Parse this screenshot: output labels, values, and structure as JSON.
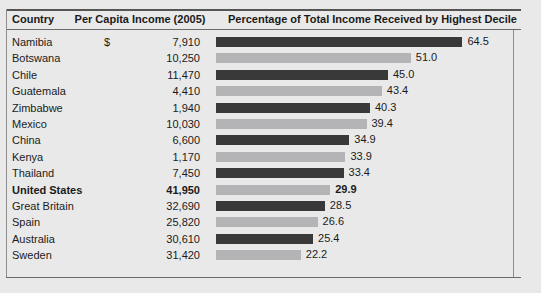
{
  "header": {
    "country": "Country",
    "income": "Per Capita Income (2005)",
    "percentage": "Percentage of Total Income Received by Highest Decile"
  },
  "colors": {
    "bar_dark": "#39393a",
    "bar_light": "#b4b4b6",
    "background": "#e9e9e9",
    "rule": "#6a6a6a"
  },
  "chart_data": {
    "type": "bar",
    "title": "Percentage of Total Income Received by Highest Decile",
    "xlabel": "",
    "ylabel": "Country",
    "orientation": "horizontal",
    "grid": false,
    "legend": "none",
    "xlim": [
      0,
      70
    ],
    "categories": [
      "Namibia",
      "Botswana",
      "Chile",
      "Guatemala",
      "Zimbabwe",
      "Mexico",
      "China",
      "Kenya",
      "Thailand",
      "United States",
      "Great Britain",
      "Spain",
      "Australia",
      "Sweden"
    ],
    "values": [
      64.5,
      51.0,
      45.0,
      43.4,
      40.3,
      39.4,
      34.9,
      33.9,
      33.4,
      29.9,
      28.5,
      26.6,
      25.4,
      22.2
    ],
    "value_labels": [
      "64.5",
      "51.0",
      "45.0",
      "43.4",
      "40.3",
      "39.4",
      "34.9",
      "33.9",
      "33.4",
      "29.9",
      "28.5",
      "26.6",
      "25.4",
      "22.2"
    ]
  },
  "rows": [
    {
      "country": "Namibia",
      "currency": "$",
      "income": "7,910",
      "value": 64.5,
      "label": "64.5",
      "shade": "dark",
      "highlight": false
    },
    {
      "country": "Botswana",
      "currency": "",
      "income": "10,250",
      "value": 51.0,
      "label": "51.0",
      "shade": "light",
      "highlight": false
    },
    {
      "country": "Chile",
      "currency": "",
      "income": "11,470",
      "value": 45.0,
      "label": "45.0",
      "shade": "dark",
      "highlight": false
    },
    {
      "country": "Guatemala",
      "currency": "",
      "income": "4,410",
      "value": 43.4,
      "label": "43.4",
      "shade": "light",
      "highlight": false
    },
    {
      "country": "Zimbabwe",
      "currency": "",
      "income": "1,940",
      "value": 40.3,
      "label": "40.3",
      "shade": "dark",
      "highlight": false
    },
    {
      "country": "Mexico",
      "currency": "",
      "income": "10,030",
      "value": 39.4,
      "label": "39.4",
      "shade": "light",
      "highlight": false
    },
    {
      "country": "China",
      "currency": "",
      "income": "6,600",
      "value": 34.9,
      "label": "34.9",
      "shade": "dark",
      "highlight": false
    },
    {
      "country": "Kenya",
      "currency": "",
      "income": "1,170",
      "value": 33.9,
      "label": "33.9",
      "shade": "light",
      "highlight": false
    },
    {
      "country": "Thailand",
      "currency": "",
      "income": "7,450",
      "value": 33.4,
      "label": "33.4",
      "shade": "dark",
      "highlight": false
    },
    {
      "country": "United States",
      "currency": "",
      "income": "41,950",
      "value": 29.9,
      "label": "29.9",
      "shade": "light",
      "highlight": true
    },
    {
      "country": "Great Britain",
      "currency": "",
      "income": "32,690",
      "value": 28.5,
      "label": "28.5",
      "shade": "dark",
      "highlight": false
    },
    {
      "country": "Spain",
      "currency": "",
      "income": "25,820",
      "value": 26.6,
      "label": "26.6",
      "shade": "light",
      "highlight": false
    },
    {
      "country": "Australia",
      "currency": "",
      "income": "30,610",
      "value": 25.4,
      "label": "25.4",
      "shade": "dark",
      "highlight": false
    },
    {
      "country": "Sweden",
      "currency": "",
      "income": "31,420",
      "value": 22.2,
      "label": "22.2",
      "shade": "light",
      "highlight": false
    }
  ],
  "scale": {
    "px_per_unit": 3.82,
    "bar_origin_x": 216
  }
}
